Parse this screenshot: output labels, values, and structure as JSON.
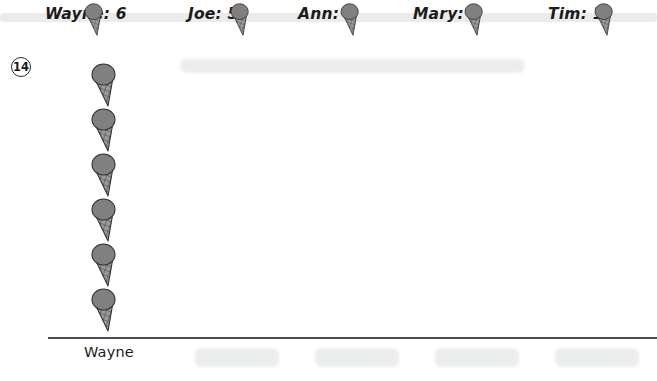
{
  "worksheet": {
    "problem_number": "14",
    "axis_label": "Wayne"
  },
  "header": {
    "entries": [
      {
        "label": "Wayne: 6",
        "name": "Wayne",
        "count": 6,
        "x": 45,
        "cone_x": 82
      },
      {
        "label": "Joe: 5",
        "name": "Joe",
        "count": 5,
        "x": 188,
        "cone_x": 228
      },
      {
        "label": "Ann: 3",
        "name": "Ann",
        "count": 3,
        "x": 298,
        "cone_x": 338
      },
      {
        "label": "Mary: 4",
        "name": "Mary",
        "count": 4,
        "x": 413,
        "cone_x": 462
      },
      {
        "label": "Tim: 1",
        "name": "Tim",
        "count": 1,
        "x": 548,
        "cone_x": 592
      }
    ]
  },
  "pictograph": {
    "icon_name": "ice-cream-cone-icon",
    "scoop_color": "#808080",
    "cone_color": "#9a9a9a",
    "outline_color": "#333333",
    "axis_color": "#4d4d52",
    "columns": [
      {
        "label": "Wayne",
        "value": 6,
        "filled": true,
        "x": 88
      },
      {
        "label": "",
        "value": 0,
        "filled": false,
        "x": 195
      },
      {
        "label": "",
        "value": 0,
        "filled": false,
        "x": 315
      },
      {
        "label": "",
        "value": 0,
        "filled": false,
        "x": 435
      },
      {
        "label": "",
        "value": 0,
        "filled": false,
        "x": 555
      }
    ]
  },
  "chart_data": {
    "type": "bar",
    "title": "",
    "xlabel": "",
    "ylabel": "",
    "categories": [
      "Wayne",
      "Joe",
      "Ann",
      "Mary",
      "Tim"
    ],
    "values": [
      6,
      5,
      3,
      4,
      1
    ],
    "ylim": [
      0,
      6
    ],
    "grid": false,
    "legend": null,
    "unit_icon": "ice-cream-cone",
    "unit_value": 1,
    "note": "Pictograph worksheet; only the Wayne column is drawn with 6 ice-cream-cone icons. Remaining columns are blank (erased smudges)."
  }
}
